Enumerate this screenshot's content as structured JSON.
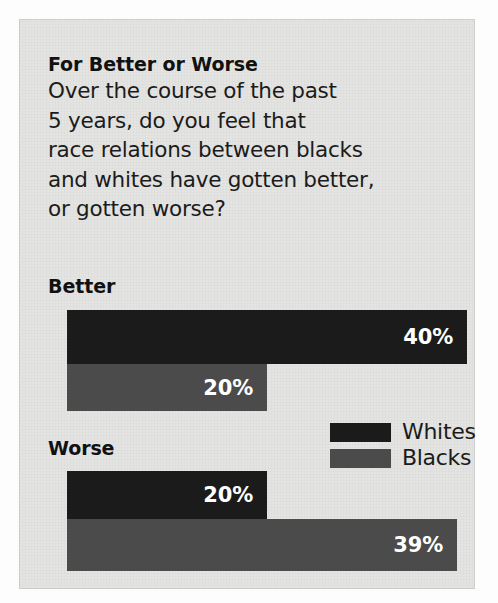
{
  "panel": {
    "headline": "For Better or Worse",
    "question_lines": [
      "Over the course of the past",
      "5 years, do you feel that",
      "race relations between blacks",
      "and whites have gotten better,",
      "or gotten worse?"
    ],
    "background_color": "#e4e4e2"
  },
  "legend": {
    "entries": [
      {
        "label": "Whites",
        "color": "#1b1b1b"
      },
      {
        "label": "Blacks",
        "color": "#4b4b4b"
      }
    ]
  },
  "groups": {
    "better": {
      "label": "Better",
      "whites_value": "40%",
      "blacks_value": "20%"
    },
    "worse": {
      "label": "Worse",
      "whites_value": "20%",
      "blacks_value": "39%"
    }
  },
  "chart_data": {
    "type": "bar",
    "orientation": "horizontal",
    "title": "For Better or Worse",
    "subtitle": "Over the course of the past 5 years, do you feel that race relations between blacks and whites have gotten better, or gotten worse?",
    "categories": [
      "Better",
      "Worse"
    ],
    "series": [
      {
        "name": "Whites",
        "values": [
          40,
          20
        ],
        "labels": [
          "40%",
          "20%"
        ],
        "color": "#1b1b1b"
      },
      {
        "name": "Blacks",
        "values": [
          20,
          39
        ],
        "labels": [
          "20%",
          "39%"
        ],
        "color": "#4b4b4b"
      }
    ],
    "value_unit": "percent",
    "xlabel": "",
    "ylabel": "",
    "xlim": [
      0,
      40
    ],
    "grid": false,
    "legend_position": "middle-right",
    "axis_ticks": false
  }
}
